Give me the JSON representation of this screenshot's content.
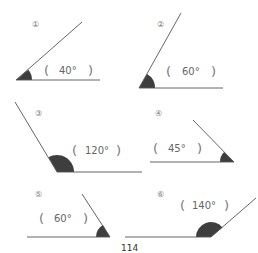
{
  "page_number": "114",
  "colors": {
    "line": "#555555",
    "wedge": "#3e3e3e",
    "text": "#666666"
  },
  "angles": [
    {
      "marker": "①",
      "answer": "40°",
      "open": "(",
      "close": ")"
    },
    {
      "marker": "②",
      "answer": "60°",
      "open": "(",
      "close": ")"
    },
    {
      "marker": "③",
      "answer": "120°",
      "open": "(",
      "close": ")"
    },
    {
      "marker": "④",
      "answer": "45°",
      "open": "(",
      "close": ")"
    },
    {
      "marker": "⑤",
      "answer": "60°",
      "open": "(",
      "close": ")"
    },
    {
      "marker": "⑥",
      "answer": "140°",
      "open": "(",
      "close": ")"
    }
  ]
}
